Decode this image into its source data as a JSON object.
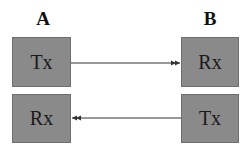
{
  "nodes": {
    "A": {
      "label": "A",
      "top": "Tx",
      "bottom": "Rx"
    },
    "B": {
      "label": "B",
      "top": "Rx",
      "bottom": "Tx"
    }
  },
  "edges": [
    {
      "from": "A.Tx",
      "to": "B.Rx",
      "style": "double-arrowhead"
    },
    {
      "from": "B.Tx",
      "to": "A.Rx",
      "style": "double-arrowhead"
    }
  ],
  "colors": {
    "box_fill": "#8a8a8a",
    "line": "#333333"
  }
}
